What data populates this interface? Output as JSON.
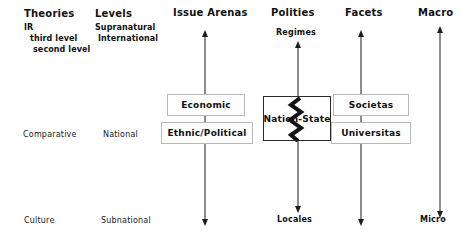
{
  "diagram": {
    "title_columns": [
      {
        "id": "theories",
        "label": "Theories"
      },
      {
        "id": "levels",
        "label": "Levels"
      },
      {
        "id": "issue-arenas",
        "label": "Issue Arenas"
      },
      {
        "id": "polities",
        "label": "Polities"
      },
      {
        "id": "facets",
        "label": "Facets"
      },
      {
        "id": "macro",
        "label": "Macro"
      }
    ],
    "theories_column": {
      "heading": "Theories",
      "items": [
        "IR",
        "third level",
        "second level"
      ],
      "middle_row_label": "Comparative",
      "bottom_row_label": "Culture"
    },
    "levels_column": {
      "heading": "Levels",
      "items": [
        "Supranatural",
        "International"
      ],
      "middle_row_label": "National",
      "bottom_row_label": "Subnational"
    },
    "issue_arenas_column": {
      "heading": "Issue Arenas",
      "boxes": [
        "Economic",
        "Ethnic/Political"
      ]
    },
    "polities_column": {
      "heading": "Polities",
      "top_label": "Regimes",
      "boxes": [
        "Nation-State"
      ],
      "bottom_label": "Locales"
    },
    "facets_column": {
      "heading": "Facets",
      "boxes": [
        "Societas",
        "Universitas"
      ]
    },
    "scale_axis": {
      "top_label": "Macro",
      "bottom_label": "Micro"
    },
    "colors": {
      "background": "#ffffff",
      "text": "#111111",
      "axis": "#1d1d1d",
      "box_border": "#b9b9b9",
      "box_border_solid": "#2a2a2a",
      "crack": "#141414"
    }
  }
}
